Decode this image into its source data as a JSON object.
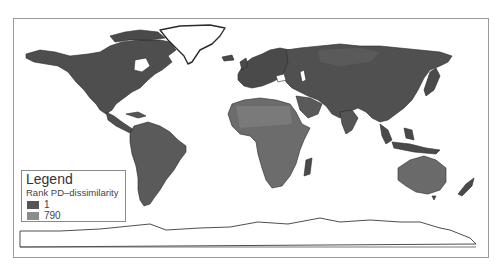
{
  "map": {
    "type": "world choropleth",
    "background": "#ffffff",
    "frame_color": "#9a9a9a",
    "land_dark": "#4a4a4a",
    "land_mid": "#6e6e6e",
    "land_light": "#8a8a8a"
  },
  "legend": {
    "title": "Legend",
    "subtitle": "Rank PD–dissimilarity",
    "items": [
      {
        "label": "1",
        "color": "#555555"
      },
      {
        "label": "790",
        "color": "#8c8c8c"
      }
    ]
  }
}
